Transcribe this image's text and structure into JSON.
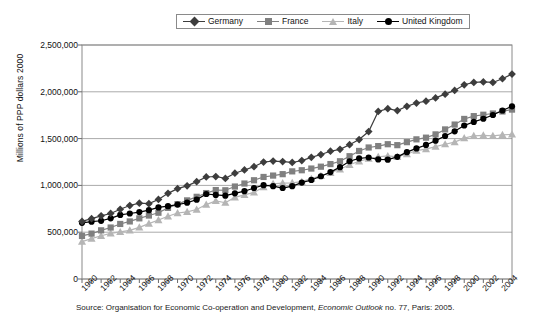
{
  "chart_data": {
    "type": "line",
    "title": "",
    "xlabel": "",
    "ylabel": "Millions of PPP dollars 2000",
    "ylim": [
      0,
      2500000
    ],
    "ytick_labels": [
      "2,500,000",
      "2,000,000",
      "1,500,000",
      "1,000,000",
      "500,000",
      "0"
    ],
    "ytick_values": [
      2500000,
      2000000,
      1500000,
      1000000,
      500000,
      0
    ],
    "grid": "horizontal",
    "legend_position": "top-center",
    "xlim": [
      1960,
      2005
    ],
    "x": [
      1960,
      1961,
      1962,
      1963,
      1964,
      1965,
      1966,
      1967,
      1968,
      1969,
      1970,
      1971,
      1972,
      1973,
      1974,
      1975,
      1976,
      1977,
      1978,
      1979,
      1980,
      1981,
      1982,
      1983,
      1984,
      1985,
      1986,
      1987,
      1988,
      1989,
      1990,
      1991,
      1992,
      1993,
      1994,
      1995,
      1996,
      1997,
      1998,
      1999,
      2000,
      2001,
      2002,
      2003,
      2004,
      2005
    ],
    "xtick_labels": [
      "1960",
      "1962",
      "1964",
      "1966",
      "1968",
      "1970",
      "1972",
      "1974",
      "1976",
      "1978",
      "1980",
      "1982",
      "1984",
      "1986",
      "1988",
      "1990",
      "1992",
      "1994",
      "1996",
      "1998",
      "2000",
      "2002",
      "2004"
    ],
    "series": [
      {
        "name": "Germany",
        "color": "#3d3d3d",
        "marker": "diamond",
        "values": [
          615000,
          645000,
          675000,
          700000,
          745000,
          785000,
          810000,
          805000,
          850000,
          915000,
          965000,
          995000,
          1040000,
          1090000,
          1095000,
          1075000,
          1130000,
          1165000,
          1200000,
          1250000,
          1260000,
          1255000,
          1245000,
          1265000,
          1300000,
          1330000,
          1365000,
          1385000,
          1435000,
          1490000,
          1575000,
          1790000,
          1820000,
          1800000,
          1845000,
          1880000,
          1900000,
          1935000,
          1975000,
          2015000,
          2075000,
          2100000,
          2105000,
          2100000,
          2140000,
          2190000
        ]
      },
      {
        "name": "France",
        "color": "#808080",
        "marker": "square",
        "values": [
          460000,
          485000,
          520000,
          550000,
          588000,
          615000,
          648000,
          678000,
          708000,
          760000,
          800000,
          840000,
          878000,
          918000,
          950000,
          948000,
          988000,
          1020000,
          1055000,
          1090000,
          1105000,
          1120000,
          1150000,
          1162000,
          1180000,
          1200000,
          1228000,
          1258000,
          1312000,
          1368000,
          1405000,
          1420000,
          1440000,
          1430000,
          1462000,
          1492000,
          1510000,
          1545000,
          1598000,
          1650000,
          1710000,
          1740000,
          1755000,
          1768000,
          1790000,
          1810000
        ]
      },
      {
        "name": "Italy",
        "color": "#b5b5b5",
        "marker": "triangle",
        "values": [
          400000,
          432000,
          462000,
          488000,
          503000,
          520000,
          552000,
          592000,
          630000,
          670000,
          705000,
          718000,
          742000,
          795000,
          835000,
          815000,
          872000,
          898000,
          925000,
          982000,
          1018000,
          1025000,
          1028000,
          1040000,
          1072000,
          1102000,
          1135000,
          1172000,
          1220000,
          1258000,
          1285000,
          1305000,
          1315000,
          1305000,
          1335000,
          1372000,
          1388000,
          1415000,
          1440000,
          1462000,
          1505000,
          1530000,
          1535000,
          1530000,
          1540000,
          1545000
        ]
      },
      {
        "name": "United Kingdom",
        "color": "#000000",
        "marker": "circle",
        "values": [
          600000,
          612000,
          622000,
          648000,
          685000,
          700000,
          715000,
          735000,
          765000,
          778000,
          795000,
          815000,
          848000,
          908000,
          898000,
          890000,
          915000,
          938000,
          972000,
          1002000,
          992000,
          972000,
          992000,
          1030000,
          1058000,
          1098000,
          1142000,
          1195000,
          1258000,
          1288000,
          1298000,
          1278000,
          1275000,
          1305000,
          1355000,
          1395000,
          1432000,
          1478000,
          1528000,
          1578000,
          1640000,
          1678000,
          1712000,
          1752000,
          1800000,
          1845000
        ]
      }
    ]
  },
  "legend": {
    "entries": [
      {
        "label": "Germany"
      },
      {
        "label": "France"
      },
      {
        "label": "Italy"
      },
      {
        "label": "United Kingdom"
      }
    ]
  },
  "source": {
    "prefix": "Source: Organisation for Economic Co-operation and Development, ",
    "italic": "Economic Outlook",
    "suffix": " no. 77, Paris: 2005."
  }
}
